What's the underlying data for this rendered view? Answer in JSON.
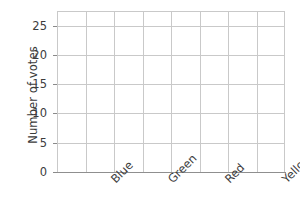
{
  "chart_data": {
    "type": "bar",
    "title": "",
    "subtitle": "",
    "xlabel": "",
    "ylabel": "Number of votes",
    "categories": [
      "Blue",
      "Green",
      "Red",
      "Yellow"
    ],
    "values": [
      null,
      null,
      null,
      null
    ],
    "series": [
      {
        "name": "Number of votes",
        "values": [
          null,
          null,
          null,
          null
        ]
      }
    ],
    "empty_plot": "true",
    "ylim": [
      0,
      27.5
    ],
    "y_ticks": [
      0,
      5,
      10,
      15,
      20,
      25
    ],
    "y_tick_labels": [
      "0",
      "5",
      "10",
      "15",
      "20",
      "25"
    ],
    "grid": "both",
    "grid_columns": 8,
    "legend": "none",
    "annotations": [],
    "colors": {
      "grid": "#c9c9c9",
      "axis": "#8f8f8f",
      "text": "#3c3c3c",
      "background": "#ffffff"
    }
  }
}
